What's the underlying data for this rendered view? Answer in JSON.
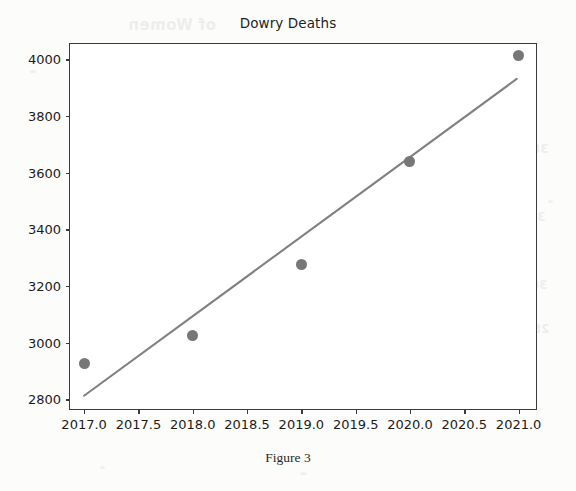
{
  "chart_data": {
    "type": "scatter",
    "title": "Dowry Deaths",
    "xlabel": "",
    "ylabel": "",
    "x": [
      2017,
      2018,
      2019,
      2020,
      2021
    ],
    "values": [
      2925,
      3025,
      3275,
      3640,
      4015
    ],
    "series": [
      {
        "name": "Dowry Deaths",
        "type": "scatter",
        "values": [
          2925,
          3025,
          3275,
          3640,
          4015
        ]
      },
      {
        "name": "Trend line",
        "type": "line",
        "x": [
          2017,
          2021
        ],
        "values": [
          2806,
          3930
        ]
      }
    ],
    "xlim": [
      2016.87,
      2021.16
    ],
    "ylim": [
      2766,
      4054
    ],
    "xticks": [
      "2017.0",
      "2017.5",
      "2018.0",
      "2018.5",
      "2019.0",
      "2019.5",
      "2020.0",
      "2020.5",
      "2021.0"
    ],
    "xtick_values": [
      2017.0,
      2017.5,
      2018.0,
      2018.5,
      2019.0,
      2019.5,
      2020.0,
      2020.5,
      2021.0
    ],
    "yticks": [
      "2800",
      "3000",
      "3200",
      "3400",
      "3600",
      "3800",
      "4000"
    ],
    "ytick_values": [
      2800,
      3000,
      3200,
      3400,
      3600,
      3800,
      4000
    ],
    "grid": false,
    "legend": "none",
    "marker_color": "#777777",
    "line_color": "#808080",
    "frame_color": "#3b3b3b"
  },
  "caption": "Figure 3",
  "artifacts": {
    "bleed_title": "of Women",
    "bleed_right": [
      "3800",
      "3400",
      "3000",
      "2800"
    ]
  }
}
